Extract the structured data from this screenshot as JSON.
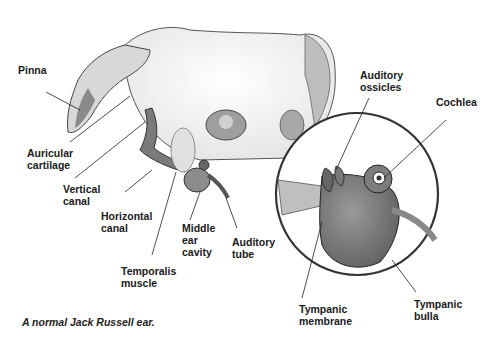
{
  "diagram": {
    "caption": "A normal Jack Russell ear.",
    "labels": {
      "pinna": "Pinna",
      "auricular_cartilage": "Auricular\ncartilage",
      "vertical_canal": "Vertical\ncanal",
      "horizontal_canal": "Horizontal\ncanal",
      "temporalis_muscle": "Temporalis\nmuscle",
      "middle_ear_cavity": "Middle\near\ncavity",
      "auditory_tube": "Auditory\ntube",
      "auditory_ossicles": "Auditory\nossicles",
      "cochlea": "Cochlea",
      "tympanic_membrane": "Tympanic\nmembrane",
      "tympanic_bulla": "Tympanic\nbulla"
    },
    "inset": "Magnified view of middle and inner ear"
  }
}
